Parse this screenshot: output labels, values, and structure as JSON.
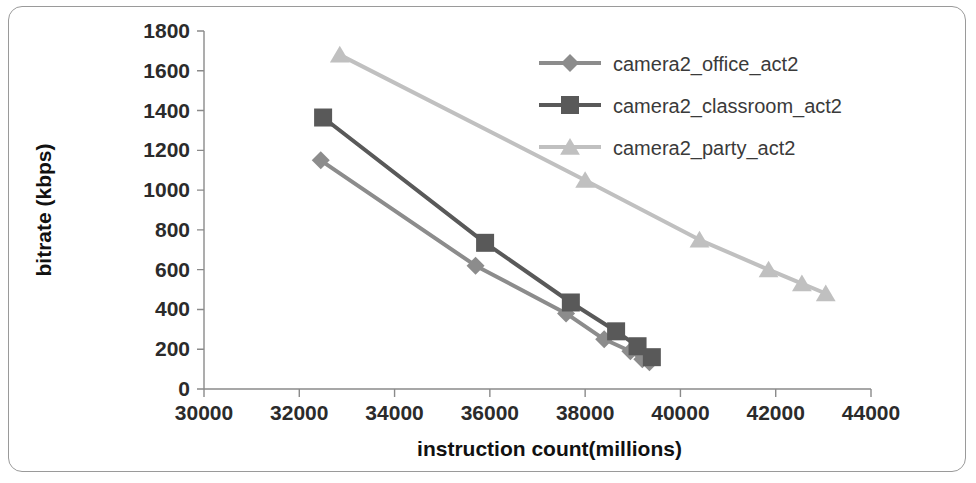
{
  "chart_data": {
    "type": "line",
    "title": "",
    "xlabel": "instruction count(millions)",
    "ylabel": "bitrate (kbps)",
    "xlim": [
      30000,
      44000
    ],
    "ylim": [
      0,
      1800
    ],
    "xticks": [
      "30000",
      "32000",
      "34000",
      "36000",
      "38000",
      "40000",
      "42000",
      "44000"
    ],
    "yticks": [
      "0",
      "200",
      "400",
      "600",
      "800",
      "1000",
      "1200",
      "1400",
      "1600",
      "1800"
    ],
    "grid": false,
    "legend_position": "top-right",
    "series": [
      {
        "name": "camera2_office_act2",
        "marker": "diamond",
        "color": "#8c8c8c",
        "x": [
          32450,
          35700,
          37600,
          38400,
          38950,
          39200,
          39350
        ],
        "y": [
          1150,
          620,
          380,
          250,
          190,
          150,
          135
        ]
      },
      {
        "name": "camera2_classroom_act2",
        "marker": "square",
        "color": "#595959",
        "x": [
          32500,
          35900,
          37700,
          38650,
          39100,
          39400
        ],
        "y": [
          1365,
          735,
          435,
          290,
          215,
          160
        ]
      },
      {
        "name": "camera2_party_act2",
        "marker": "triangle",
        "color": "#c0c0c0",
        "x": [
          32850,
          38000,
          40400,
          41850,
          42550,
          43050
        ],
        "y": [
          1680,
          1050,
          750,
          600,
          530,
          480
        ]
      }
    ]
  },
  "legend": {
    "entries": [
      {
        "label": "camera2_office_act2"
      },
      {
        "label": "camera2_classroom_act2"
      },
      {
        "label": "camera2_party_act2"
      }
    ]
  }
}
